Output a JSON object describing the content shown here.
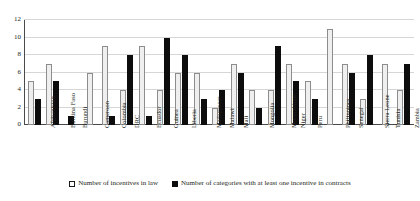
{
  "chart_data": {
    "type": "bar",
    "title": "",
    "subtitle": "",
    "xlabel": "",
    "ylabel": "",
    "ylim": [
      0,
      12
    ],
    "yticks": [
      0,
      2,
      4,
      6,
      8,
      10,
      12
    ],
    "grid": true,
    "legend_position": "bottom",
    "categories": [
      "Afghanistan",
      "Burkina Faso",
      "Burundi",
      "Cameroon",
      "Colombia",
      "DRC",
      "Ecuador",
      "Guinea",
      "Liberia",
      "Madagascar",
      "Malawi",
      "Mali",
      "Mongolia",
      "Mozambique",
      "Niger",
      "Peru",
      "Philippines",
      "Senegal",
      "Sierra Leone",
      "Tunisia",
      "Zambia"
    ],
    "series": [
      {
        "name": "Number of incentives in law",
        "color": "#efefef",
        "edge_color": "#8d8d8d",
        "values": [
          5,
          7,
          0,
          6,
          9,
          4,
          9,
          4,
          6,
          6,
          2,
          7,
          4,
          4,
          7,
          5,
          11,
          7,
          3,
          7,
          4
        ]
      },
      {
        "name": "Number of categories with at least one incentive in contracts",
        "color": "#0d0d0d",
        "edge_color": "#0d0d0d",
        "values": [
          3,
          5,
          1,
          0,
          1,
          8,
          1,
          10,
          8,
          3,
          4,
          6,
          2,
          9,
          5,
          3,
          0,
          6,
          8,
          0,
          7
        ]
      }
    ]
  },
  "legend": {
    "items": [
      {
        "label": "Number of incentives in law",
        "marker": "open-square-marker"
      },
      {
        "label": "Number of categories with at least one incentive in contracts",
        "marker": "filled-square-marker"
      }
    ]
  }
}
